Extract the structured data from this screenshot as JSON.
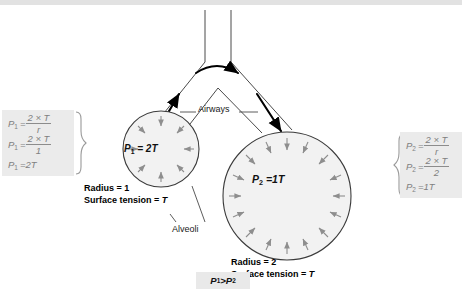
{
  "figure": {
    "title_hidden": "",
    "left_panel": {
      "lines": [
        {
          "lhs": "P1",
          "num": "2 × T",
          "den": "r"
        },
        {
          "lhs": "P1",
          "num": "2 × T",
          "den": "1"
        }
      ],
      "result": {
        "lhs": "P1",
        "value": "2T"
      }
    },
    "right_panel": {
      "lines": [
        {
          "lhs": "P2",
          "num": "2 × T",
          "den": "r"
        },
        {
          "lhs": "P2",
          "num": "2 × T",
          "den": "2"
        }
      ],
      "result": {
        "lhs": "P2",
        "value": "1T"
      }
    },
    "small_alveolus": {
      "pressure_label": "P",
      "pressure_sub": "1",
      "pressure_value": "= 2T",
      "radius_caption": "Radius = 1",
      "tension_caption": "Surface tension = ",
      "tension_symbol": "T"
    },
    "large_alveolus": {
      "pressure_label": "P",
      "pressure_sub": "2",
      "pressure_value": "=1T",
      "radius_caption": "Radius = 2",
      "tension_caption": "Surface tension = ",
      "tension_symbol": "T"
    },
    "callouts": {
      "airways": "Airways",
      "alveoli": "Alveoli"
    },
    "comparison_box": {
      "left": "P",
      "left_sub": "1",
      "operator": " > ",
      "right": "P",
      "right_sub": "2"
    },
    "colors": {
      "background": "#ffffff",
      "panel_fill": "#ebebeb",
      "panel_text": "#808080",
      "alveolus_fill": "#f2f2f2",
      "alveolus_stroke": "#3b3b3b",
      "tension_arrow": "#8e8e8e",
      "airflow_arrow": "#000000",
      "top_band": "#e2e2e2"
    }
  }
}
